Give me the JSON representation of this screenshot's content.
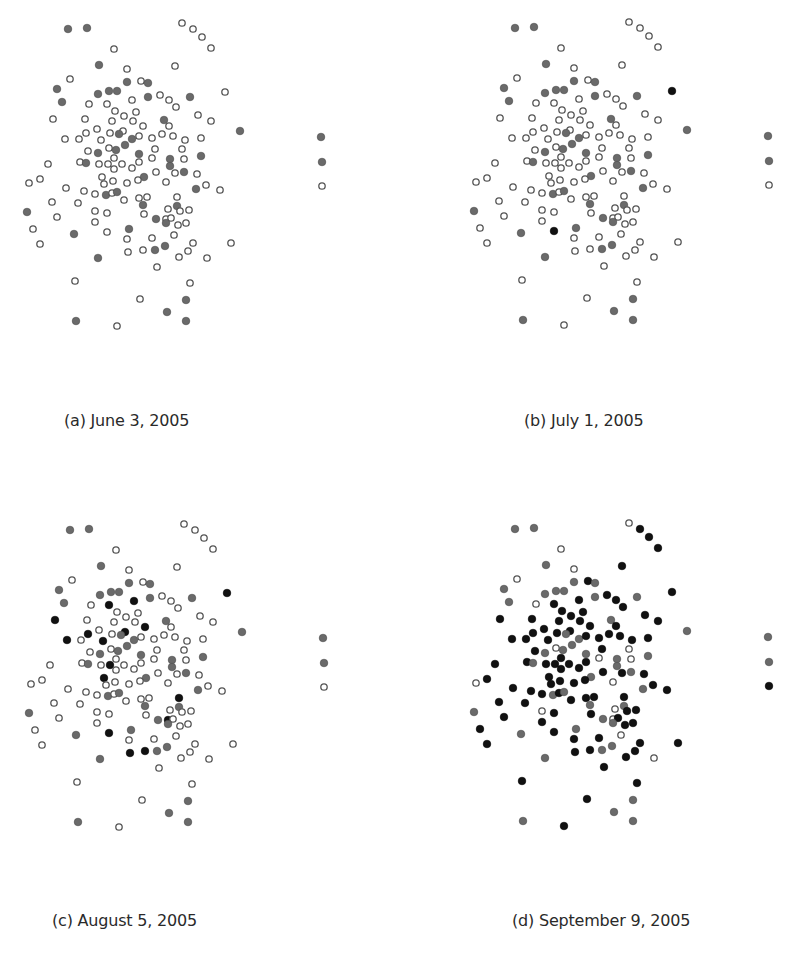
{
  "figure": {
    "panels": [
      {
        "id": "a",
        "caption": "(a) June 3, 2005"
      },
      {
        "id": "b",
        "caption": "(b) July 1, 2005"
      },
      {
        "id": "c",
        "caption": "(c) August 5, 2005"
      },
      {
        "id": "d",
        "caption": "(d) September 9, 2005"
      }
    ]
  },
  "colors": {
    "open_stroke": "#555555",
    "open_fill": "#ffffff",
    "gray_fill": "#6a6a6a",
    "black_fill": "#111111"
  },
  "chart_data": {
    "type": "scatter",
    "title": "",
    "xlabel": "",
    "ylabel": "",
    "grid": false,
    "legend": "none",
    "panel_offsets": {
      "a": [
        0,
        0
      ],
      "b": [
        447,
        -1
      ],
      "c": [
        2,
        501
      ],
      "d": [
        447,
        500
      ]
    },
    "points": [
      [
        68,
        29
      ],
      [
        87,
        28
      ],
      [
        182,
        23
      ],
      [
        193,
        29
      ],
      [
        202,
        37
      ],
      [
        211,
        48
      ],
      [
        114,
        49
      ],
      [
        99,
        65
      ],
      [
        175,
        66
      ],
      [
        127,
        69
      ],
      [
        70,
        79
      ],
      [
        127,
        82
      ],
      [
        141,
        81
      ],
      [
        148,
        83
      ],
      [
        57,
        89
      ],
      [
        98,
        94
      ],
      [
        109,
        91
      ],
      [
        117,
        91
      ],
      [
        225,
        92
      ],
      [
        160,
        95
      ],
      [
        148,
        97
      ],
      [
        169,
        100
      ],
      [
        190,
        97
      ],
      [
        62,
        102
      ],
      [
        132,
        100
      ],
      [
        89,
        104
      ],
      [
        107,
        104
      ],
      [
        176,
        107
      ],
      [
        115,
        111
      ],
      [
        136,
        112
      ],
      [
        124,
        116
      ],
      [
        198,
        115
      ],
      [
        53,
        119
      ],
      [
        85,
        119
      ],
      [
        112,
        121
      ],
      [
        133,
        121
      ],
      [
        164,
        120
      ],
      [
        211,
        121
      ],
      [
        169,
        126
      ],
      [
        97,
        129
      ],
      [
        143,
        126
      ],
      [
        240,
        131
      ],
      [
        123,
        131
      ],
      [
        86,
        133
      ],
      [
        110,
        133
      ],
      [
        119,
        134
      ],
      [
        162,
        134
      ],
      [
        173,
        136
      ],
      [
        65,
        139
      ],
      [
        79,
        139
      ],
      [
        101,
        140
      ],
      [
        132,
        139
      ],
      [
        139,
        136
      ],
      [
        152,
        138
      ],
      [
        185,
        140
      ],
      [
        201,
        138
      ],
      [
        125,
        145
      ],
      [
        109,
        148
      ],
      [
        116,
        150
      ],
      [
        155,
        149
      ],
      [
        182,
        149
      ],
      [
        88,
        151
      ],
      [
        98,
        153
      ],
      [
        114,
        158
      ],
      [
        139,
        154
      ],
      [
        152,
        158
      ],
      [
        170,
        159
      ],
      [
        184,
        159
      ],
      [
        201,
        156
      ],
      [
        48,
        164
      ],
      [
        80,
        162
      ],
      [
        86,
        163
      ],
      [
        99,
        164
      ],
      [
        108,
        164
      ],
      [
        122,
        164
      ],
      [
        139,
        162
      ],
      [
        114,
        169
      ],
      [
        132,
        168
      ],
      [
        170,
        166
      ],
      [
        156,
        172
      ],
      [
        175,
        173
      ],
      [
        184,
        172
      ],
      [
        197,
        174
      ],
      [
        102,
        177
      ],
      [
        144,
        177
      ],
      [
        29,
        183
      ],
      [
        40,
        179
      ],
      [
        104,
        184
      ],
      [
        113,
        181
      ],
      [
        127,
        183
      ],
      [
        138,
        180
      ],
      [
        166,
        182
      ],
      [
        66,
        188
      ],
      [
        84,
        191
      ],
      [
        95,
        194
      ],
      [
        106,
        195
      ],
      [
        112,
        193
      ],
      [
        117,
        192
      ],
      [
        196,
        189
      ],
      [
        206,
        185
      ],
      [
        220,
        190
      ],
      [
        52,
        202
      ],
      [
        78,
        203
      ],
      [
        124,
        200
      ],
      [
        139,
        198
      ],
      [
        147,
        197
      ],
      [
        143,
        205
      ],
      [
        177,
        197
      ],
      [
        177,
        206
      ],
      [
        27,
        212
      ],
      [
        95,
        211
      ],
      [
        107,
        213
      ],
      [
        168,
        209
      ],
      [
        180,
        211
      ],
      [
        189,
        210
      ],
      [
        144,
        214
      ],
      [
        57,
        217
      ],
      [
        156,
        219
      ],
      [
        166,
        219
      ],
      [
        171,
        218
      ],
      [
        166,
        223
      ],
      [
        178,
        225
      ],
      [
        186,
        223
      ],
      [
        95,
        222
      ],
      [
        33,
        229
      ],
      [
        129,
        229
      ],
      [
        74,
        234
      ],
      [
        107,
        232
      ],
      [
        174,
        235
      ],
      [
        127,
        239
      ],
      [
        152,
        238
      ],
      [
        40,
        244
      ],
      [
        193,
        243
      ],
      [
        231,
        243
      ],
      [
        155,
        250
      ],
      [
        165,
        246
      ],
      [
        143,
        250
      ],
      [
        128,
        252
      ],
      [
        188,
        251
      ],
      [
        179,
        257
      ],
      [
        98,
        258
      ],
      [
        207,
        258
      ],
      [
        157,
        267
      ],
      [
        75,
        281
      ],
      [
        190,
        283
      ],
      [
        140,
        299
      ],
      [
        186,
        300
      ],
      [
        167,
        312
      ],
      [
        76,
        321
      ],
      [
        117,
        326
      ],
      [
        186,
        321
      ],
      [
        321,
        137
      ],
      [
        322,
        162
      ],
      [
        322,
        186
      ]
    ],
    "states": {
      "a": "ggoooooggooggggggggogggogooooooooooooogooggoooooogoggoooogooooooogoogooooooooooooooogogoooooooooggggoooooggoooooooooooggogoooooggooooooooooogggoooggooooooggo ggg",
      "legend_note": "o = open circle, g = gray filled, b = black filled"
    }
  }
}
